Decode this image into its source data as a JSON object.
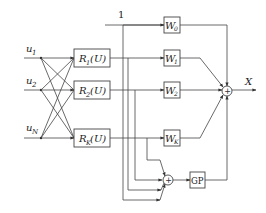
{
  "diagram": {
    "type": "block-diagram",
    "inputs": [
      {
        "label": "u",
        "sub": "1"
      },
      {
        "label": "u",
        "sub": "2"
      },
      {
        "label": "u",
        "sub": "N"
      }
    ],
    "rbf_blocks": [
      {
        "label": "R",
        "sub": "1",
        "arg": "(U)"
      },
      {
        "label": "R",
        "sub": "2",
        "arg": "(U)"
      },
      {
        "label": "R",
        "sub": "K",
        "arg": "(U)"
      }
    ],
    "bias_label": "1",
    "weights": [
      {
        "label": "W",
        "sub": "0"
      },
      {
        "label": "W",
        "sub": "1"
      },
      {
        "label": "W",
        "sub": "2"
      },
      {
        "label": "W",
        "sub": "K"
      }
    ],
    "output_label": "X",
    "gp_block": "GP",
    "sum_symbol": "+"
  }
}
